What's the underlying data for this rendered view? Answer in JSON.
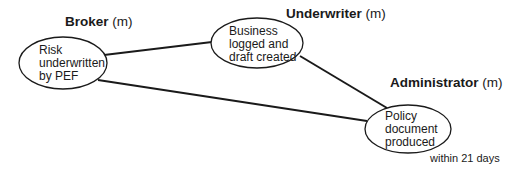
{
  "diagram": {
    "roles": [
      {
        "name": "Broker",
        "suffix": "(m)"
      },
      {
        "name": "Underwriter",
        "suffix": "(m)"
      },
      {
        "name": "Administrator",
        "suffix": "(m)"
      }
    ],
    "nodes": [
      {
        "id": "broker",
        "lines": [
          "Risk",
          "underwritten",
          "by PEF"
        ]
      },
      {
        "id": "underwriter",
        "lines": [
          "Business",
          "logged and",
          "draft created"
        ]
      },
      {
        "id": "administrator",
        "lines": [
          "Policy",
          "document",
          "produced"
        ]
      }
    ],
    "edges": [
      {
        "from": "broker",
        "to": "underwriter"
      },
      {
        "from": "broker",
        "to": "administrator"
      },
      {
        "from": "underwriter",
        "to": "administrator"
      }
    ],
    "note": "within 21 days",
    "colors": {
      "stroke": "#1a1a1a",
      "background": "#ffffff"
    }
  }
}
